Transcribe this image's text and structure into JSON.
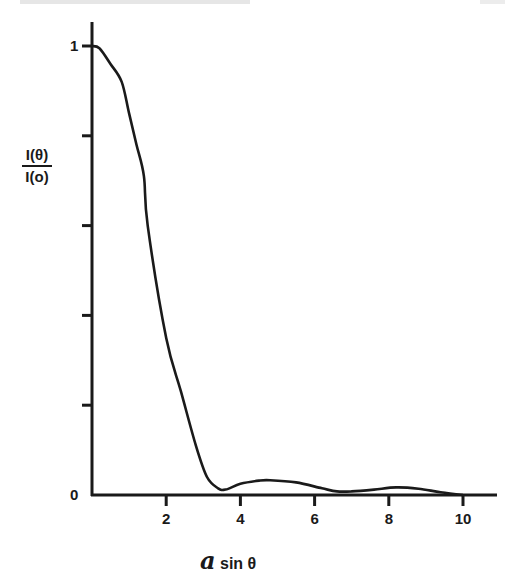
{
  "chart_data": {
    "type": "line",
    "title": "",
    "xlabel": "a sin θ",
    "ylabel": "I(θ) / I(o)",
    "ylabel_numerator": "I(θ)",
    "ylabel_denominator": "I(o)",
    "xlabel_symbol": "a",
    "xlabel_rest": "sin θ",
    "xlim": [
      0,
      11
    ],
    "ylim": [
      0,
      1
    ],
    "x_ticks": [
      2,
      4,
      6,
      8,
      10
    ],
    "x_tick_labels": [
      "2",
      "4",
      "6",
      "8",
      "10"
    ],
    "y_ticks": [
      0,
      0.2,
      0.4,
      0.6,
      0.8,
      1
    ],
    "y_tick_labels": [
      "0",
      "",
      "",
      "",
      "",
      "1"
    ],
    "grid": false,
    "legend": null,
    "series": [
      {
        "name": "I(θ)/I(o)",
        "x": [
          0,
          0.2,
          0.5,
          0.8,
          1.0,
          1.2,
          1.4,
          1.5,
          2.0,
          2.4,
          2.8,
          3.1,
          3.4,
          3.6,
          4.0,
          4.5,
          4.8,
          5.5,
          6.2,
          6.6,
          7.0,
          7.6,
          8.2,
          8.8,
          9.4,
          10.0
        ],
        "y": [
          1.0,
          0.995,
          0.96,
          0.92,
          0.85,
          0.78,
          0.71,
          0.6,
          0.35,
          0.23,
          0.11,
          0.04,
          0.015,
          0.012,
          0.025,
          0.032,
          0.033,
          0.028,
          0.015,
          0.008,
          0.008,
          0.012,
          0.017,
          0.014,
          0.006,
          0.0
        ]
      }
    ]
  }
}
